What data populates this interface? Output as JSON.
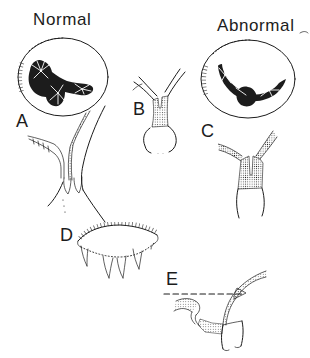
{
  "diagram": {
    "colors": {
      "ink": "#1c1c1c",
      "background": "#ffffff"
    },
    "headers": {
      "normal": "Normal",
      "abnormal": "Abnormal"
    },
    "figure_labels": {
      "a": "A",
      "b": "B",
      "c": "C",
      "d": "D",
      "e": "E"
    }
  }
}
